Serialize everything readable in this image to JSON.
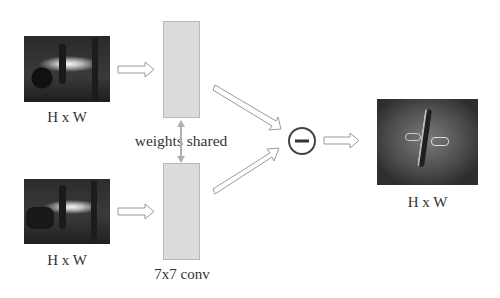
{
  "diagram": {
    "inputs": [
      {
        "label": "H x W",
        "description": "input frame (top)"
      },
      {
        "label": "H x W",
        "description": "input frame (bottom)"
      }
    ],
    "conv_blocks": [
      {
        "label": ""
      },
      {
        "label": "7x7 conv"
      }
    ],
    "shared_label": "weights shared",
    "operator": {
      "symbol": "−",
      "name": "subtraction"
    },
    "output": {
      "label": "H x W",
      "description": "difference feature map"
    },
    "colors": {
      "arrow_stroke": "#9a9a9a",
      "arrow_fill": "#ffffff",
      "conv_fill": "#dcdcdc",
      "shared_arrow": "#b0b0b0",
      "text": "#333333",
      "circle_stroke": "#444444"
    }
  }
}
